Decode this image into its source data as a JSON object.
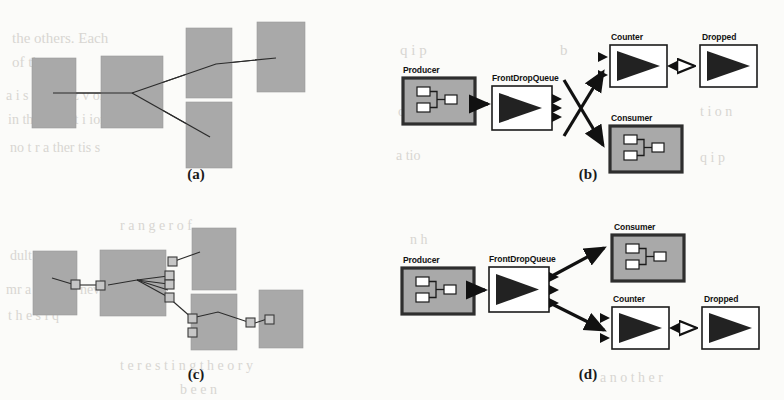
{
  "figure": {
    "background_color": "#fbfbf9",
    "box_fill": "#a9a9a9",
    "box_stroke": "#3a3a3a",
    "line_color": "#222222",
    "white_fill": "#ffffff",
    "panels": [
      {
        "id": "a",
        "caption": "(a)",
        "kind": "abstract-block-graph",
        "description": "plain grey rectangles joined by thin lines",
        "blocks": [
          {
            "name": "block-1",
            "x": 32,
            "y": 58,
            "w": 44,
            "h": 70
          },
          {
            "name": "block-2",
            "x": 101,
            "y": 56,
            "w": 62,
            "h": 72
          },
          {
            "name": "block-3",
            "x": 186,
            "y": 28,
            "w": 46,
            "h": 70
          },
          {
            "name": "block-4",
            "x": 186,
            "y": 102,
            "w": 46,
            "h": 66
          },
          {
            "name": "block-5",
            "x": 257,
            "y": 22,
            "w": 48,
            "h": 70
          }
        ]
      },
      {
        "id": "b",
        "caption": "(b)",
        "kind": "component-graph",
        "nodes": [
          {
            "name": "Producer",
            "type": "composite",
            "label": "Producer"
          },
          {
            "name": "FrontDropQueue",
            "type": "primitive",
            "label": "FrontDropQueue"
          },
          {
            "name": "Counter",
            "type": "primitive",
            "label": "Counter"
          },
          {
            "name": "Dropped",
            "type": "primitive",
            "label": "Dropped"
          },
          {
            "name": "Consumer",
            "type": "composite",
            "label": "Consumer"
          }
        ],
        "edges": [
          {
            "from": "Producer",
            "to": "FrontDropQueue",
            "arrow": "filled"
          },
          {
            "from": "FrontDropQueue",
            "to": "Counter",
            "arrow": "filled"
          },
          {
            "from": "FrontDropQueue",
            "to": "Consumer",
            "arrow": "filled"
          },
          {
            "from": "Counter",
            "to": "Dropped",
            "arrow": "hollow"
          }
        ]
      },
      {
        "id": "c",
        "caption": "(c)",
        "kind": "abstract-block-graph-with-ports",
        "description": "grey rectangles with small square ports joined by thin lines",
        "blocks": [
          {
            "name": "block-1",
            "x": 33,
            "y": 251,
            "w": 44,
            "h": 64
          },
          {
            "name": "block-2",
            "x": 100,
            "y": 250,
            "w": 66,
            "h": 66
          },
          {
            "name": "block-3",
            "x": 192,
            "y": 228,
            "w": 44,
            "h": 62
          },
          {
            "name": "block-4",
            "x": 191,
            "y": 294,
            "w": 46,
            "h": 56
          },
          {
            "name": "block-5",
            "x": 259,
            "y": 290,
            "w": 44,
            "h": 58
          }
        ]
      },
      {
        "id": "d",
        "caption": "(d)",
        "kind": "component-graph",
        "nodes": [
          {
            "name": "Producer",
            "type": "composite",
            "label": "Producer"
          },
          {
            "name": "FrontDropQueue",
            "type": "primitive",
            "label": "FrontDropQueue"
          },
          {
            "name": "Consumer",
            "type": "composite",
            "label": "Consumer"
          },
          {
            "name": "Counter",
            "type": "primitive",
            "label": "Counter"
          },
          {
            "name": "Dropped",
            "type": "primitive",
            "label": "Dropped"
          }
        ],
        "edges": [
          {
            "from": "Producer",
            "to": "FrontDropQueue",
            "arrow": "filled"
          },
          {
            "from": "FrontDropQueue",
            "to": "Consumer",
            "arrow": "filled"
          },
          {
            "from": "FrontDropQueue",
            "to": "Counter",
            "arrow": "filled"
          },
          {
            "from": "Counter",
            "to": "Dropped",
            "arrow": "hollow"
          }
        ]
      }
    ],
    "labels": {
      "producer": "Producer",
      "frontdropqueue": "FrontDropQueue",
      "counter": "Counter",
      "dropped": "Dropped",
      "consumer": "Consumer"
    },
    "captions": {
      "a": "(a)",
      "b": "(b)",
      "c": "(c)",
      "d": "(d)"
    }
  },
  "ghost_text": [
    {
      "t": "the others. Each",
      "x": 12,
      "y": 30,
      "s": 15
    },
    {
      "t": "of the",
      "x": 12,
      "y": 54,
      "s": 15
    },
    {
      "t": "a i s a-nr-ia  z  v olt",
      "x": 6,
      "y": 88,
      "s": 14
    },
    {
      "t": "in the p  a ti t i  ion of",
      "x": 8,
      "y": 112,
      "s": 14
    },
    {
      "t": "no  t  r  a ther  tis  s",
      "x": 10,
      "y": 140,
      "s": 14
    },
    {
      "t": "q i p",
      "x": 400,
      "y": 42,
      "s": 15
    },
    {
      "t": "b",
      "x": 560,
      "y": 42,
      "s": 15
    },
    {
      "t": "q  i  t  y:",
      "x": 700,
      "y": 42,
      "s": 15
    },
    {
      "t": "o  p",
      "x": 398,
      "y": 104,
      "s": 14
    },
    {
      "t": "t  i  o  n",
      "x": 700,
      "y": 104,
      "s": 14
    },
    {
      "t": "a tio",
      "x": 396,
      "y": 148,
      "s": 14
    },
    {
      "t": "q  i  p",
      "x": 700,
      "y": 150,
      "s": 14
    },
    {
      "t": "r  a  n  g  e  r  o  f",
      "x": 120,
      "y": 218,
      "s": 14
    },
    {
      "t": "dult  ar",
      "x": 10,
      "y": 248,
      "s": 14
    },
    {
      "t": "mr  a  s  ha  s  x  nev",
      "x": 6,
      "y": 282,
      "s": 14
    },
    {
      "t": "t  h  e  s   i      q",
      "x": 8,
      "y": 308,
      "s": 14
    },
    {
      "t": "t  e  r  e  s  t  i  n  g     t h  e  o  r  y",
      "x": 120,
      "y": 358,
      "s": 14
    },
    {
      "t": "b  e  e  n",
      "x": 180,
      "y": 382,
      "s": 14
    },
    {
      "t": "n  h",
      "x": 410,
      "y": 232,
      "s": 14
    },
    {
      "t": "a  n  o  t  h  e  r",
      "x": 600,
      "y": 370,
      "s": 14
    }
  ]
}
